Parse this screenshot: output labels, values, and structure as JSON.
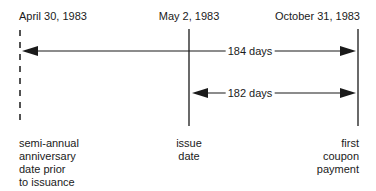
{
  "diagram": {
    "type": "timeline",
    "dates": [
      {
        "label": "April 30, 1983",
        "x": 20,
        "line": "dashed"
      },
      {
        "label": "May 2, 1983",
        "x": 189,
        "line": "solid"
      },
      {
        "label": "October 31, 1983",
        "x": 358,
        "line": "solid"
      }
    ],
    "descriptions": [
      {
        "text": [
          "semi-annual",
          "anniversary",
          "date prior",
          "to issuance"
        ]
      },
      {
        "text": [
          "issue",
          "date"
        ]
      },
      {
        "text": [
          "first",
          "coupon",
          "payment"
        ]
      }
    ],
    "spans": [
      {
        "label": "184 days",
        "from": "April 30, 1983",
        "to": "October 31, 1983"
      },
      {
        "label": "182 days",
        "from": "May 2, 1983",
        "to": "October 31, 1983"
      }
    ],
    "colors": {
      "line": "#1a1a1a",
      "background": "#ffffff"
    }
  }
}
